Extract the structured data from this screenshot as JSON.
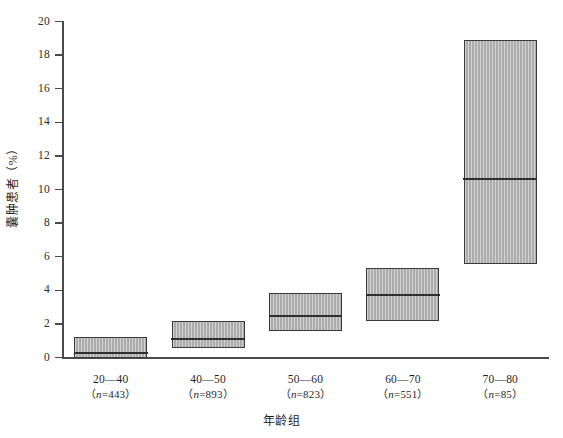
{
  "chart_data": {
    "type": "bar",
    "title": "",
    "subtitle": "",
    "xlabel": "年龄组",
    "ylabel": "囊肿患者（%）",
    "grid": false,
    "legend": "none",
    "ylim": [
      0,
      20
    ],
    "yticks": [
      0,
      2,
      4,
      6,
      8,
      10,
      12,
      14,
      16,
      18,
      20
    ],
    "ytick_labels": [
      "0",
      "2",
      "4",
      "6",
      "8",
      "10",
      "12",
      "14",
      "16",
      "18",
      "20"
    ],
    "categories": [
      "20—40",
      "40—50",
      "50—60",
      "60—70",
      "70—80"
    ],
    "category_counts": [
      "（n=443）",
      "（n=893）",
      "（n=823）",
      "（n=551）",
      "（n=85）"
    ],
    "n_values": [
      443,
      893,
      823,
      551,
      85
    ],
    "series": [
      {
        "name": "囊肿患病率区间",
        "bars": [
          {
            "category": "20—40",
            "low": 0.0,
            "median": 0.35,
            "high": 1.25
          },
          {
            "category": "40—50",
            "low": 0.55,
            "median": 1.15,
            "high": 2.2
          },
          {
            "category": "50—60",
            "low": 1.55,
            "median": 2.55,
            "high": 3.85
          },
          {
            "category": "60—70",
            "low": 2.2,
            "median": 3.75,
            "high": 5.35
          },
          {
            "category": "70—80",
            "low": 5.55,
            "median": 10.7,
            "high": 18.9
          }
        ]
      }
    ],
    "colors": {
      "bar_fill": "#b4b4b4",
      "bar_border": "#3a3a3a",
      "median_line": "#2e2e2e",
      "axis": "#4a4a4a",
      "text": "#1f1f1f",
      "background": "#ffffff"
    }
  }
}
